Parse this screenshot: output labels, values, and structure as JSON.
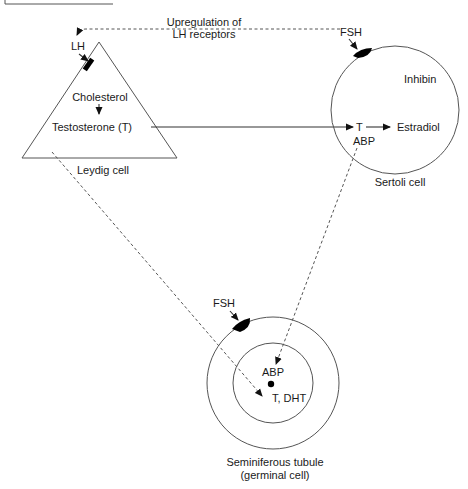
{
  "header_box": {
    "label": ""
  },
  "feedback": {
    "line1": "Upregulation of",
    "line2": "LH receptors"
  },
  "leydig": {
    "hormone": "LH",
    "precursor": "Cholesterol",
    "product": "Testosterone (T)",
    "caption": "Leydig cell"
  },
  "sertoli": {
    "hormone": "FSH",
    "secretes": "Inhibin",
    "substrate": "T",
    "product": "Estradiol",
    "binding_protein": "ABP",
    "caption": "Sertoli cell"
  },
  "tubule": {
    "hormone": "FSH",
    "binding_protein": "ABP",
    "androgens": "T, DHT",
    "caption_line1": "Seminiferous tubule",
    "caption_line2": "(germinal cell)"
  },
  "colors": {
    "stroke": "#555555",
    "text": "#1a1a1a",
    "receptor": "#000000",
    "background": "#ffffff"
  }
}
